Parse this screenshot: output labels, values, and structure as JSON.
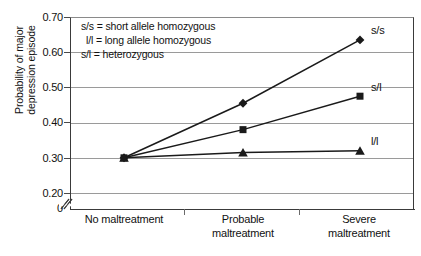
{
  "chart_data": {
    "type": "line",
    "title": "",
    "xlabel": "",
    "ylabel": "Probability of major depression episode",
    "ylabel_lines": [
      "Probability of major",
      "depression episode"
    ],
    "categories": [
      "No maltreatment",
      "Probable maltreatment",
      "Severe maltreatment"
    ],
    "category_lines": [
      [
        "No maltreatment"
      ],
      [
        "Probable",
        "maltreatment"
      ],
      [
        "Severe",
        "maltreatment"
      ]
    ],
    "ylim": [
      0.0,
      0.7
    ],
    "yticks": [
      0.7,
      0.6,
      0.5,
      0.4,
      0.3,
      0.2,
      0.0
    ],
    "ytick_labels": [
      "0.70",
      "0.60",
      "0.50",
      "0.40",
      "0.30",
      "0.20",
      "0"
    ],
    "grid": true,
    "grid_axis": "y",
    "axis_break": true,
    "axis_break_note": "y-axis broken between 0 and 0.20",
    "legend_position": "inside-top-left",
    "series": [
      {
        "name": "s/s",
        "marker": "diamond",
        "color": "#1a1a1a",
        "values": [
          0.3,
          0.455,
          0.635
        ],
        "end_label": "s/s"
      },
      {
        "name": "s/l",
        "marker": "square",
        "color": "#1a1a1a",
        "values": [
          0.3,
          0.38,
          0.475
        ],
        "end_label": "s/l"
      },
      {
        "name": "l/l",
        "marker": "triangle",
        "color": "#1a1a1a",
        "values": [
          0.3,
          0.315,
          0.32
        ],
        "end_label": "l/l"
      }
    ],
    "annotations": [
      "s/s = short allele homozygous",
      "l/l = long allele homozygous",
      "s/l = heterozygous"
    ]
  },
  "legend": {
    "line_1": "s/s = short allele homozygous",
    "line_2": "l/l = long allele homozygous",
    "line_3": "s/l = heterozygous"
  },
  "axis": {
    "y_title_line_1": "Probability of major",
    "y_title_line_2": "depression episode",
    "ytick_0": "0.70",
    "ytick_1": "0.60",
    "ytick_2": "0.50",
    "ytick_3": "0.40",
    "ytick_4": "0.30",
    "ytick_5": "0.20",
    "ytick_6": "0",
    "xtick_0_line_1": "No maltreatment",
    "xtick_1_line_1": "Probable",
    "xtick_1_line_2": "maltreatment",
    "xtick_2_line_1": "Severe",
    "xtick_2_line_2": "maltreatment"
  },
  "series_labels": {
    "ss": "s/s",
    "sl": "s/l",
    "ll": "l/l"
  },
  "colors": {
    "series": "#1a1a1a",
    "grid": "#9a9a9a",
    "axis": "#3a3a3a",
    "text": "#111111",
    "background": "#ffffff"
  }
}
